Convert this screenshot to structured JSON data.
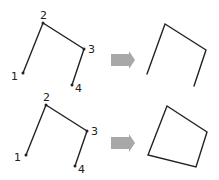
{
  "diagram": {
    "rows": [
      {
        "name": "open-polyline",
        "source": {
          "points": [
            {
              "label": "1",
              "x": 23,
              "y": 73,
              "lx": 11,
              "ly": 80
            },
            {
              "label": "2",
              "x": 43,
              "y": 23,
              "lx": 40,
              "ly": 19
            },
            {
              "label": "3",
              "x": 84,
              "y": 49,
              "lx": 88,
              "ly": 53
            },
            {
              "label": "4",
              "x": 72,
              "y": 85,
              "lx": 75,
              "ly": 92
            }
          ]
        },
        "result": {
          "closed": false,
          "path": "147,74 165,24 206,50 194,86"
        }
      },
      {
        "name": "closed-polygon",
        "source": {
          "points": [
            {
              "label": "1",
              "x": 26,
              "y": 155,
              "lx": 14,
              "ly": 161
            },
            {
              "label": "2",
              "x": 46,
              "y": 105,
              "lx": 43,
              "ly": 101
            },
            {
              "label": "3",
              "x": 87,
              "y": 131,
              "lx": 91,
              "ly": 135
            },
            {
              "label": "4",
              "x": 75,
              "y": 166,
              "lx": 78,
              "ly": 173
            }
          ]
        },
        "result": {
          "closed": true,
          "path": "148,155 167,106 207,132 196,167"
        }
      }
    ],
    "arrows": [
      {
        "direction": "right",
        "y": 60
      },
      {
        "direction": "right",
        "y": 143
      }
    ],
    "colors": {
      "line": "#222222",
      "arrow": "#a8a8a8",
      "background": "#ffffff"
    }
  }
}
